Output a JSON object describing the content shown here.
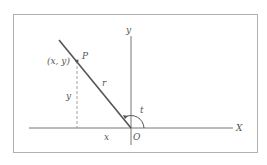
{
  "diagram": {
    "title": "",
    "labels": {
      "x_axis": "X",
      "y_axis": "y",
      "origin": "O",
      "point": "P",
      "coords": "(x, y)",
      "radius": "r",
      "angle": "t",
      "x_length": "x",
      "y_length": "y"
    },
    "colors": {
      "frame": "#b0b0b0",
      "axes": "#777777",
      "ray": "#555555",
      "dashed": "#888888",
      "text": "#555555"
    }
  }
}
